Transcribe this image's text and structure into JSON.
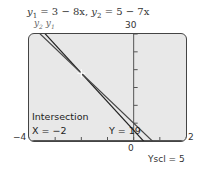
{
  "chart_data": {
    "type": "line",
    "title": "y1 = 3 − 8x,   y2 = 5 − 7x",
    "series": [
      {
        "name": "y1",
        "label": "y₁",
        "equation": "3 − 8x",
        "slope": -8,
        "intercept": 3
      },
      {
        "name": "y2",
        "label": "y₂",
        "equation": "5 − 7x",
        "slope": -7,
        "intercept": 5
      }
    ],
    "xlim": [
      -4,
      2
    ],
    "ylim": [
      0,
      30
    ],
    "xscl": 1,
    "yscl": 5,
    "x_tick_labels": {
      "left": "−4",
      "right": "2",
      "origin": "0"
    },
    "y_tick_labels": {
      "top": "30"
    },
    "annotation": {
      "title": "Intersection",
      "x_text": "X = −2",
      "y_text": "Y = 19",
      "x": -2,
      "y": 19
    },
    "yscl_label": "Yscl = 5"
  },
  "text": {
    "eq_y1_var": "y",
    "eq_y1_sub": "1",
    "eq_y1_rhs": " = 3 − 8x,   ",
    "eq_y2_var": "y",
    "eq_y2_sub": "2",
    "eq_y2_rhs": " = 5 − 7x",
    "series_y2": "y",
    "series_y2_sub": "2",
    "series_y1": " y",
    "series_y1_sub": "1"
  }
}
